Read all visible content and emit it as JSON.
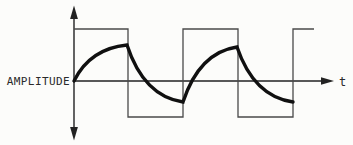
{
  "figure": {
    "y_axis_label": "AMPLITUDE",
    "x_axis_label": "t",
    "colors": {
      "background": "#fcfcfa",
      "axis": "#222222",
      "square_wave": "#4a4a4a",
      "response_curve": "#101010"
    },
    "axes": {
      "origin": {
        "x": 74,
        "y": 81
      },
      "vertical": {
        "x": 74,
        "tip_top": 5.5,
        "tip_bottom": 140.5,
        "head_len": 13.5,
        "head_halfwidth": 3.9
      },
      "horizontal": {
        "y": 81,
        "left": 74,
        "tip_right": 334,
        "head_len": 13,
        "head_halfwidth": 3.7
      }
    },
    "square_wave": {
      "high_y": 29,
      "low_y": 117,
      "stroke_width": 1.3,
      "points": [
        [
          74,
          29
        ],
        [
          128,
          29
        ],
        [
          128,
          117
        ],
        [
          183,
          117
        ],
        [
          183,
          29
        ],
        [
          238,
          29
        ],
        [
          238,
          117
        ],
        [
          293,
          117
        ],
        [
          293,
          29
        ],
        [
          314,
          29
        ]
      ]
    },
    "response_curve": {
      "stroke_width": 3.4,
      "start": [
        74,
        81
      ],
      "segments": [
        {
          "to": [
            127,
            45
          ],
          "shape": "exp"
        },
        {
          "to": [
            183,
            102
          ],
          "shape": "exp"
        },
        {
          "to": [
            237,
            47
          ],
          "shape": "exp"
        },
        {
          "to": [
            293,
            102
          ],
          "shape": "exp"
        }
      ]
    }
  }
}
